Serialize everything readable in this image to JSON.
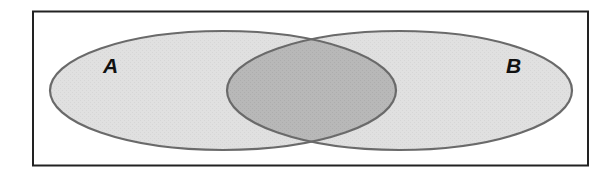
{
  "diagram": {
    "type": "venn",
    "sets": [
      {
        "id": "A",
        "label": "A",
        "fill": "#e0e0e0",
        "stroke": "#6a6a6a"
      },
      {
        "id": "B",
        "label": "B",
        "fill": "#e0e0e0",
        "stroke": "#6a6a6a"
      }
    ],
    "intersection": {
      "sets": [
        "A",
        "B"
      ],
      "fill": "#b6b6b6"
    },
    "universe": {
      "border_color": "#222222",
      "background": "#ffffff"
    }
  }
}
